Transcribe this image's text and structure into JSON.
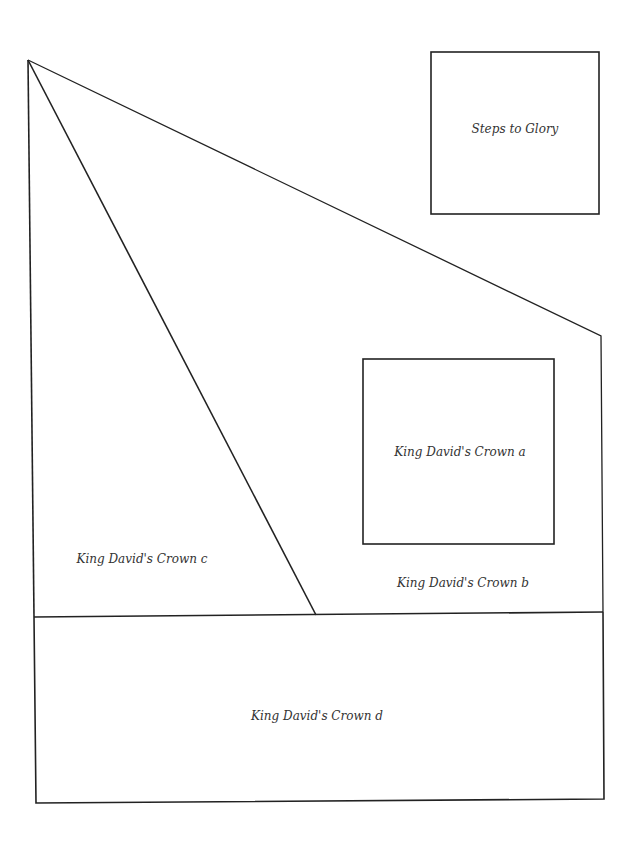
{
  "diagram": {
    "line_color": "#222222",
    "background": "#ffffff",
    "pieces": [
      {
        "id": "steps",
        "label": "Steps to Glory"
      },
      {
        "id": "a",
        "label": "King David's Crown a"
      },
      {
        "id": "b",
        "label": "King David's Crown b"
      },
      {
        "id": "c",
        "label": "King David's Crown c"
      },
      {
        "id": "d",
        "label": "King David's Crown d"
      }
    ]
  }
}
